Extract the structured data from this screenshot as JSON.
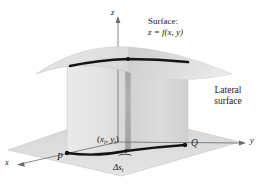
{
  "figure": {
    "kind": "3d-surface-lateral-surface-diagram",
    "background_color": "#ffffff",
    "ink_color": "#1a1a1a"
  },
  "axes": {
    "z_label": "z",
    "x_label": "x",
    "y_label": "y"
  },
  "labels": {
    "surface_line1": "Surface:",
    "surface_line2_z": "z",
    "surface_line2_eq": " = ",
    "surface_line2_f": "f",
    "surface_line2_args": "(x, y)",
    "lateral_line1": "Lateral",
    "lateral_line2": "surface",
    "point_p": "P",
    "point_q": "Q",
    "sample_point_open": "(",
    "sample_point_x": "x",
    "sample_point_xsub": "i",
    "sample_point_comma": ", ",
    "sample_point_y": "y",
    "sample_point_ysub": "i",
    "sample_point_close": ")",
    "arc_delta": "Δ",
    "arc_s": "s",
    "arc_sub": "i",
    "brace": "⏜"
  },
  "colors": {
    "surface_fill": "#d8d8d8",
    "surface_fill_light": "#e6e6e6",
    "curtain_fill": "#dcdcdc",
    "curtain_fill_front": "#e9e9e9",
    "ground_fill": "#dedede",
    "strip_fill": "#9a9a9a",
    "curve_stroke": "#141414",
    "axis_stroke": "#555555"
  },
  "geometry": {
    "origin": {
      "x": 118,
      "y": 142
    },
    "z_axis_top": {
      "x": 118,
      "y": 18
    },
    "x_axis_end": {
      "x": 16,
      "y": 166
    },
    "y_axis_end": {
      "x": 247,
      "y": 143
    },
    "p_point": {
      "x": 67,
      "y": 153
    },
    "q_point": {
      "x": 185,
      "y": 145
    },
    "sample_point": {
      "x": 126,
      "y": 151
    },
    "surface_curve_left": {
      "x": 70,
      "y": 66
    },
    "surface_curve_right": {
      "x": 188,
      "y": 62
    },
    "surface_sample_top": {
      "x": 128,
      "y": 59
    }
  }
}
